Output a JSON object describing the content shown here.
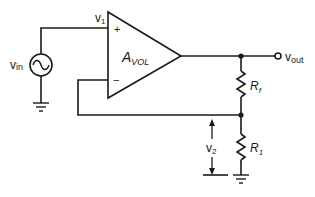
{
  "diagram": {
    "type": "op-amp non-inverting amplifier circuit",
    "colors": {
      "line": "#1a1a1a",
      "background": "#ffffff"
    },
    "components": {
      "source": {
        "label": "v",
        "sub": "in",
        "icon": "ac-source-icon"
      },
      "opamp": {
        "label": "A",
        "sub": "VOL",
        "plus": "+",
        "minus": "−"
      },
      "rf": {
        "label": "R",
        "sub": "f"
      },
      "r1": {
        "label": "R",
        "sub": "1"
      }
    },
    "nodes": {
      "v1": {
        "label": "v",
        "sub": "1"
      },
      "vout": {
        "label": "v",
        "sub": "out"
      },
      "v2": {
        "label": "v",
        "sub": "2"
      }
    }
  }
}
